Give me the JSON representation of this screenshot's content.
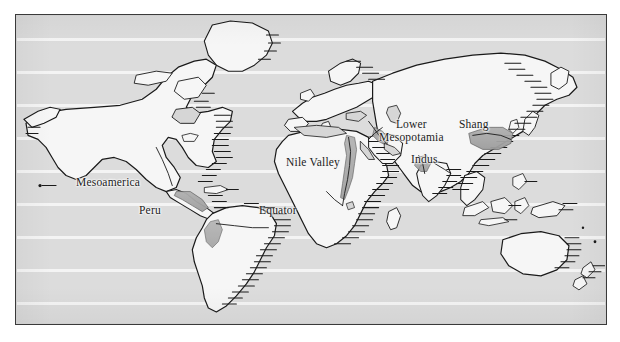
{
  "figure": {
    "kind": "world-map",
    "frame": {
      "x": 15,
      "y": 14,
      "width": 592,
      "height": 311
    }
  },
  "colors": {
    "page_background": "#ffffff",
    "ocean": "#dcdcdc",
    "land": "#f6f6f6",
    "land_outline": "#1a1a1a",
    "civilization_shading": "#a8a8a8",
    "latitude_line": "#f4f4f4",
    "frame_border": "#3a3a3a",
    "label_text": "#1b1b1b"
  },
  "map": {
    "latitude_lines": [
      24,
      57,
      90,
      123,
      156,
      189,
      222,
      255,
      288
    ],
    "equator": {
      "label": "Equator",
      "x": 258,
      "y": 203
    },
    "labels": [
      {
        "id": "mesoamerica",
        "text": "Mesoamerica",
        "x": 75,
        "y": 175,
        "lines": 1
      },
      {
        "id": "peru",
        "text": "Peru",
        "x": 138,
        "y": 203,
        "lines": 1
      },
      {
        "id": "nile-valley",
        "text": "Nile Valley",
        "x": 285,
        "y": 155,
        "lines": 1
      },
      {
        "id": "lower-mesopotamia",
        "text": "Lower\nMesopotamia",
        "x": 378,
        "y": 117,
        "lines": 2
      },
      {
        "id": "indus",
        "text": "Indus",
        "x": 410,
        "y": 152,
        "lines": 1
      },
      {
        "id": "shang",
        "text": "Shang",
        "x": 458,
        "y": 117,
        "lines": 1
      }
    ],
    "civilizations": [
      {
        "id": "mesoamerica",
        "name": "Mesoamerica",
        "region": "Central America / Gulf coast of Mexico"
      },
      {
        "id": "peru",
        "name": "Peru",
        "region": "Andean coast of South America"
      },
      {
        "id": "nile-valley",
        "name": "Nile Valley",
        "region": "Northeast Africa along the Nile"
      },
      {
        "id": "lower-mesopotamia",
        "name": "Lower Mesopotamia",
        "region": "Tigris-Euphrates delta"
      },
      {
        "id": "indus",
        "name": "Indus",
        "region": "Northwest South Asia"
      },
      {
        "id": "shang",
        "name": "Shang",
        "region": "Yellow River valley, North China"
      }
    ],
    "continents": [
      "North America",
      "South America",
      "Europe",
      "Africa",
      "Asia",
      "Australia",
      "Greenland"
    ]
  }
}
